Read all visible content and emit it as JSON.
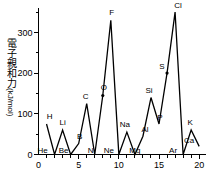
{
  "chart_data": {
    "type": "line",
    "title": "",
    "subtitle": "",
    "xlabel": "",
    "ylabel": "電子親和力",
    "ylabel_unit": "(kJ/mol)",
    "xlim": [
      0,
      20.6
    ],
    "ylim": [
      0,
      360
    ],
    "grid": false,
    "legend": "none",
    "x_ticks_major": [
      0,
      5,
      10,
      15,
      20
    ],
    "x_tick_labels": [
      "0",
      "5",
      "10",
      "15",
      "20"
    ],
    "x_ticks_minor": [
      1,
      2,
      3,
      4,
      6,
      7,
      8,
      9,
      11,
      12,
      13,
      14,
      16,
      17,
      18,
      19
    ],
    "y_ticks_major": [
      0,
      100,
      200,
      300
    ],
    "y_tick_labels": [
      "0",
      "100",
      "200",
      "300"
    ],
    "y_ticks_minor": [
      50,
      150,
      250,
      350
    ],
    "series_name": "electron affinity",
    "x": [
      1,
      2,
      3,
      4,
      5,
      6,
      7,
      8,
      9,
      10,
      11,
      12,
      13,
      14,
      15,
      16,
      17,
      18,
      19,
      20
    ],
    "values": [
      75,
      0,
      60,
      0,
      27,
      125,
      0,
      145,
      330,
      0,
      55,
      0,
      45,
      140,
      75,
      200,
      350,
      0,
      60,
      20
    ],
    "point_labels": [
      {
        "symbol": "H",
        "x": 1,
        "y": 75,
        "dx": 3,
        "dy": -5
      },
      {
        "symbol": "He",
        "x": 2,
        "y": 0,
        "dx": -12,
        "dy": -2
      },
      {
        "symbol": "Li",
        "x": 3,
        "y": 60,
        "dx": 0,
        "dy": -5
      },
      {
        "symbol": "Be",
        "x": 4,
        "y": 0,
        "dx": -7,
        "dy": -2
      },
      {
        "symbol": "B",
        "x": 5,
        "y": 27,
        "dx": 1,
        "dy": -5
      },
      {
        "symbol": "C",
        "x": 6,
        "y": 125,
        "dx": -1,
        "dy": -5
      },
      {
        "symbol": "N",
        "x": 7,
        "y": 0,
        "dx": -4,
        "dy": -2
      },
      {
        "symbol": "O",
        "x": 8,
        "y": 145,
        "dx": 1,
        "dy": -5
      },
      {
        "symbol": "F",
        "x": 9,
        "y": 330,
        "dx": 1,
        "dy": -5
      },
      {
        "symbol": "Ne",
        "x": 10,
        "y": 0,
        "dx": -10,
        "dy": -2
      },
      {
        "symbol": "Na",
        "x": 11,
        "y": 55,
        "dx": -2,
        "dy": -5
      },
      {
        "symbol": "Mg",
        "x": 12,
        "y": 0,
        "dx": 0,
        "dy": -2
      },
      {
        "symbol": "Al",
        "x": 13,
        "y": 45,
        "dx": 2,
        "dy": -4
      },
      {
        "symbol": "Si",
        "x": 14,
        "y": 140,
        "dx": -2,
        "dy": -5
      },
      {
        "symbol": "P",
        "x": 15,
        "y": 75,
        "dx": 1,
        "dy": -4
      },
      {
        "symbol": "S",
        "x": 16,
        "y": 200,
        "dx": -5,
        "dy": -4
      },
      {
        "symbol": "Cl",
        "x": 17,
        "y": 350,
        "dx": 3,
        "dy": -4
      },
      {
        "symbol": "Ar",
        "x": 18,
        "y": 0,
        "dx": -10,
        "dy": -2
      },
      {
        "symbol": "K",
        "x": 19,
        "y": 60,
        "dx": -1,
        "dy": -5
      },
      {
        "symbol": "Ca",
        "x": 20,
        "y": 20,
        "dx": -10,
        "dy": -3
      }
    ],
    "marker_points": [
      {
        "x": 8,
        "y": 145
      },
      {
        "x": 16,
        "y": 200
      }
    ]
  }
}
